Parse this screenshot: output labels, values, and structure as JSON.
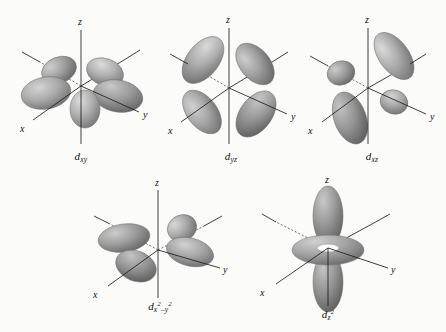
{
  "figure": {
    "background_color": "#fbfbf9",
    "lobe_color_light": "#d6d6d6",
    "lobe_color_mid": "#a8a8a8",
    "lobe_color_dark": "#6e6e6e",
    "axis_color": "#1d1d1d",
    "label_color": "#111111"
  },
  "orbitals": [
    {
      "id": "dxy",
      "caption_base": "d",
      "caption_sub": "xy",
      "caption_sup": "",
      "caption_plain": "dxy",
      "axes": [
        {
          "name": "z",
          "label": "z"
        },
        {
          "name": "y",
          "label": "y"
        },
        {
          "name": "x",
          "label": "x"
        }
      ],
      "lobe_count": 4,
      "plane": "xy",
      "description": "four lobes lying between the x and y axes in the xy plane"
    },
    {
      "id": "dyz",
      "caption_base": "d",
      "caption_sub": "yz",
      "caption_sup": "",
      "caption_plain": "dyz",
      "axes": [
        {
          "name": "z",
          "label": "z"
        },
        {
          "name": "y",
          "label": "y"
        },
        {
          "name": "x",
          "label": "x"
        }
      ],
      "lobe_count": 4,
      "plane": "yz",
      "description": "four lobes lying between the y and z axes in the yz plane"
    },
    {
      "id": "dxz",
      "caption_base": "d",
      "caption_sub": "xz",
      "caption_sup": "",
      "caption_plain": "dxz",
      "axes": [
        {
          "name": "z",
          "label": "z"
        },
        {
          "name": "y",
          "label": "y"
        },
        {
          "name": "x",
          "label": "x"
        }
      ],
      "lobe_count": 4,
      "plane": "xz",
      "description": "four lobes lying between the x and z axes in the xz plane"
    },
    {
      "id": "dx2-y2",
      "caption_base": "d",
      "caption_sub": "x",
      "caption_sub_sup": "2",
      "caption_op": "–",
      "caption_sub2": "y",
      "caption_sub2_sup": "2",
      "caption_plain": "dx2-y2",
      "axes": [
        {
          "name": "z",
          "label": "z"
        },
        {
          "name": "y",
          "label": "y"
        },
        {
          "name": "x",
          "label": "x"
        }
      ],
      "lobe_count": 4,
      "plane": "xy",
      "description": "four lobes lying along the x and y axes"
    },
    {
      "id": "dz2",
      "caption_base": "d",
      "caption_sub": "z",
      "caption_sup": "2",
      "caption_plain": "dz2",
      "axes": [
        {
          "name": "z",
          "label": "z"
        },
        {
          "name": "y",
          "label": "y"
        },
        {
          "name": "x",
          "label": "x"
        }
      ],
      "lobe_count": 2,
      "plane": "z-axis with xy torus",
      "description": "two lobes along the z axis with a doughnut-shaped torus in the xy plane"
    }
  ]
}
